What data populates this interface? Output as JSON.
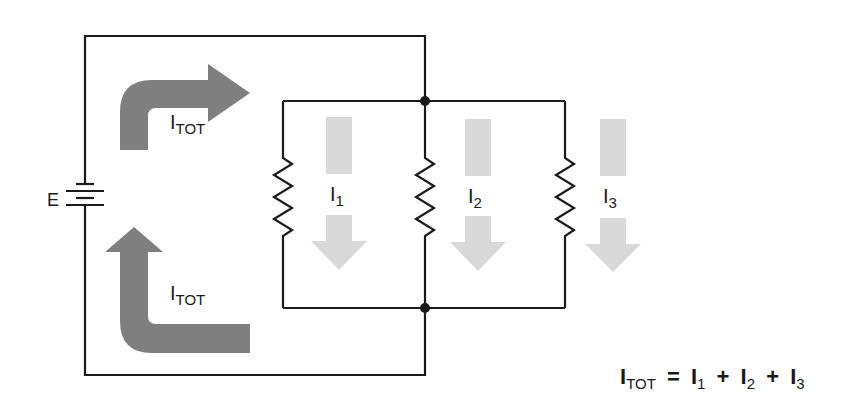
{
  "diagram": {
    "type": "parallel-circuit",
    "source": {
      "label": "E"
    },
    "total_current": {
      "symbol": "I",
      "subscript": "TOT"
    },
    "branches": [
      {
        "symbol": "I",
        "subscript": "1"
      },
      {
        "symbol": "I",
        "subscript": "2"
      },
      {
        "symbol": "I",
        "subscript": "3"
      }
    ],
    "equation": {
      "lhs_symbol": "I",
      "lhs_subscript": "TOT",
      "equals": "=",
      "plus": "+",
      "terms": [
        {
          "symbol": "I",
          "subscript": "1"
        },
        {
          "symbol": "I",
          "subscript": "2"
        },
        {
          "symbol": "I",
          "subscript": "3"
        }
      ]
    },
    "colors": {
      "wire": "#1a1a1a",
      "total_arrow": "#7f7f7f",
      "branch_arrow": "#d9d9d9"
    }
  }
}
